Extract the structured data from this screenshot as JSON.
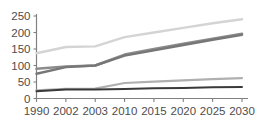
{
  "chart_data": {
    "type": "line",
    "title": "",
    "subtitle": "",
    "xlabel": "",
    "ylabel": "",
    "categories": [
      "1990",
      "2002",
      "2003",
      "2010",
      "2015",
      "2020",
      "2025",
      "2030"
    ],
    "x_tick_labels": [
      "1990",
      "2002",
      "2003",
      "2010",
      "2015",
      "2020",
      "2025",
      "2030"
    ],
    "y_tick_labels": [
      "0",
      "50",
      "100",
      "150",
      "200",
      "250"
    ],
    "y_ticks": [
      0,
      50,
      100,
      150,
      200,
      250
    ],
    "ylim": [
      0,
      250
    ],
    "grid": false,
    "legend": "none",
    "axes": {
      "left": true,
      "bottom": true,
      "top": false,
      "right": false
    },
    "series": [
      {
        "name": "series-1",
        "color": "#d4d4d4",
        "width": 2.4,
        "values": [
          137,
          156,
          158,
          186,
          200,
          214,
          228,
          240
        ]
      },
      {
        "name": "series-2",
        "color": "#8c8c8c",
        "width": 2.6,
        "values": [
          90,
          97,
          100,
          133,
          150,
          166,
          181,
          196
        ]
      },
      {
        "name": "series-3",
        "color": "#777777",
        "width": 2.4,
        "values": [
          75,
          95,
          100,
          130,
          146,
          162,
          178,
          193
        ]
      },
      {
        "name": "series-4",
        "color": "#b0b0b0",
        "width": 2.2,
        "values": [
          25,
          29,
          30,
          47,
          51,
          55,
          59,
          62
        ]
      },
      {
        "name": "series-5",
        "color": "#3a3a3a",
        "width": 2.0,
        "values": [
          22,
          27,
          27,
          29,
          31,
          32,
          34,
          35
        ]
      }
    ]
  },
  "colors": {
    "axis": "#808080",
    "tick_text": "#4d4d4d",
    "background": "#ffffff"
  }
}
